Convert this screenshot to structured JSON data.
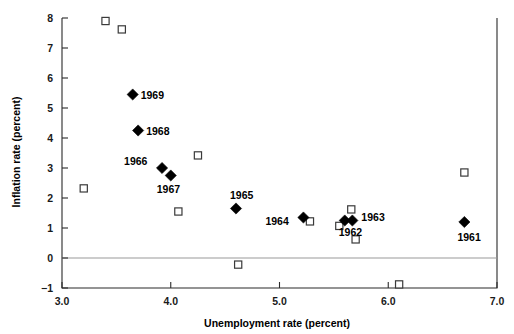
{
  "chart_data": {
    "type": "scatter",
    "title": "",
    "xlabel": "Unemployment rate (percent)",
    "ylabel": "Inflation rate (percent)",
    "xlim": [
      3.0,
      7.0
    ],
    "ylim": [
      -1,
      8
    ],
    "xticks": [
      "3.0",
      "4.0",
      "5.0",
      "6.0",
      "7.0"
    ],
    "xtick_values": [
      3.0,
      4.0,
      5.0,
      6.0,
      7.0
    ],
    "yticks": [
      "8",
      "7",
      "6",
      "5",
      "4",
      "3",
      "2",
      "1",
      "0",
      "-1"
    ],
    "ytick_values": [
      8,
      7,
      6,
      5,
      4,
      3,
      2,
      1,
      0,
      -1
    ],
    "grid": false,
    "legend": null,
    "zero_reference_line": 0,
    "series": [
      {
        "name": "labeled-years",
        "marker": "filled-diamond",
        "color": "#000000",
        "points": [
          {
            "label": "1969",
            "x": 3.65,
            "y": 5.45,
            "label_dx": 8,
            "label_dy": 4
          },
          {
            "label": "1968",
            "x": 3.7,
            "y": 4.25,
            "label_dx": 8,
            "label_dy": 4
          },
          {
            "label": "1966",
            "x": 3.92,
            "y": 3.0,
            "label_dx": -38,
            "label_dy": -3
          },
          {
            "label": "1967",
            "x": 4.0,
            "y": 2.75,
            "label_dx": -14,
            "label_dy": 17
          },
          {
            "label": "1965",
            "x": 4.6,
            "y": 1.65,
            "label_dx": -6,
            "label_dy": -10
          },
          {
            "label": "1964",
            "x": 5.22,
            "y": 1.35,
            "label_dx": -38,
            "label_dy": 7
          },
          {
            "label": "1963",
            "x": 5.67,
            "y": 1.25,
            "label_dx": 9,
            "label_dy": 0
          },
          {
            "label": "1962",
            "x": 5.6,
            "y": 1.25,
            "label_dx": -6,
            "label_dy": 15
          },
          {
            "label": "1961",
            "x": 6.7,
            "y": 1.2,
            "label_dx": -7,
            "label_dy": 19
          }
        ]
      },
      {
        "name": "unlabeled-observations",
        "marker": "open-square",
        "color": "#3a3a3a",
        "points": [
          {
            "x": 3.4,
            "y": 7.9
          },
          {
            "x": 3.55,
            "y": 7.62
          },
          {
            "x": 3.2,
            "y": 2.32
          },
          {
            "x": 4.25,
            "y": 3.42
          },
          {
            "x": 4.07,
            "y": 1.55
          },
          {
            "x": 4.62,
            "y": -0.22
          },
          {
            "x": 5.28,
            "y": 1.22
          },
          {
            "x": 5.66,
            "y": 1.62
          },
          {
            "x": 5.55,
            "y": 1.07
          },
          {
            "x": 5.7,
            "y": 0.62
          },
          {
            "x": 6.1,
            "y": -0.88
          },
          {
            "x": 6.7,
            "y": 2.85
          }
        ]
      }
    ]
  },
  "axes": {
    "x_title": "Unemployment rate (percent)",
    "y_title": "Inflation rate (percent)"
  }
}
